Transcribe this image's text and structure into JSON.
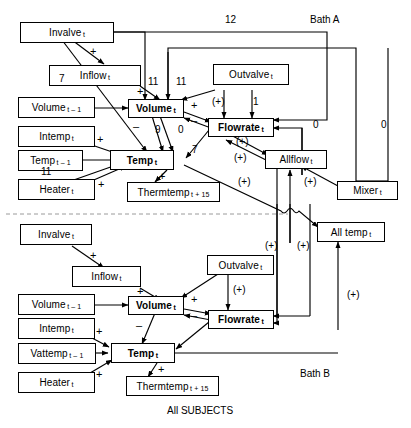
{
  "figure": {
    "caption": "All SUBJECTS",
    "panel_a_label": "Bath A",
    "panel_b_label": "Bath B"
  },
  "nodes": {
    "a_invalve": {
      "label": "Invalve",
      "sub": "t"
    },
    "a_inflow": {
      "label": "Inflow",
      "sub": "t"
    },
    "a_volume_p": {
      "label": "Volume",
      "sub": "t – 1"
    },
    "a_volume": {
      "label": "Volume",
      "sub": "t"
    },
    "a_intemp": {
      "label": "Intemp",
      "sub": "t"
    },
    "a_temp_p": {
      "label": "Temp",
      "sub": "t – 1"
    },
    "a_temp": {
      "label": "Temp",
      "sub": "t"
    },
    "a_heater": {
      "label": "Heater",
      "sub": "t"
    },
    "a_thermtemp": {
      "label": "Thermtemp",
      "sub": "t + 15"
    },
    "a_outvalve": {
      "label": "Outvalve",
      "sub": "t"
    },
    "a_flowrate": {
      "label": "Flowrate",
      "sub": "t"
    },
    "a_allflow": {
      "label": "Allflow",
      "sub": "t"
    },
    "a_mixer": {
      "label": "Mixer",
      "sub": "t"
    },
    "a_alltemp": {
      "label": "All temp",
      "sub": "t"
    },
    "b_invalve": {
      "label": "Invalve",
      "sub": "t"
    },
    "b_inflow": {
      "label": "Inflow",
      "sub": "t"
    },
    "b_volume_p": {
      "label": "Volume",
      "sub": "t – 1"
    },
    "b_volume": {
      "label": "Volume",
      "sub": "t"
    },
    "b_intemp": {
      "label": "Intemp",
      "sub": "t"
    },
    "b_vattemp_p": {
      "label": "Vattemp",
      "sub": "t – 1"
    },
    "b_temp": {
      "label": "Temp",
      "sub": "t"
    },
    "b_heater": {
      "label": "Heater",
      "sub": "t"
    },
    "b_thermtemp": {
      "label": "Thermtemp",
      "sub": "t + 15"
    },
    "b_outvalve": {
      "label": "Outvalve",
      "sub": "t"
    },
    "b_flowrate": {
      "label": "Flowrate",
      "sub": "t"
    }
  },
  "edge_labels": {
    "top_12": "12",
    "a_invalve_temp_7": "7",
    "a_inflow_plus": "+",
    "a_invalve_plus": "+",
    "a_vol_in_11a": "11",
    "a_vol_in_11b": "11",
    "a_vol_flow_plus": "+",
    "a_flow_vol_minus": "–",
    "a_outvalve_pp": "(+)",
    "a_outvalve_1": "1",
    "a_vol_temp_minus": "–",
    "a_vol_temp_9": "9",
    "a_flow_temp_0": "0",
    "a_flow_temp_7": "7",
    "a_intemp_plus": "+",
    "a_heater_plus": "+",
    "a_temp_11": "11",
    "a_thermtemp_plus": "+",
    "a_allflow_pp1": "(+)",
    "a_allflow_pp2": "(+)",
    "a_alltemp_pp": "(+)",
    "a_mixer_pp": "(+)",
    "a_mixer_0": "0",
    "a_right_0": "0",
    "b_inflow_plus": "+",
    "b_vol_plus": "+",
    "b_vol_flow_plus": "+",
    "b_flow_vol_minus": "–",
    "b_outvalve_pp": "(+)",
    "b_vol_temp_minus": "–",
    "b_intemp_plus": "+",
    "b_heater_plus": "+",
    "b_thermtemp_plus": "+",
    "b_flow_pp": "(+)",
    "b_alltemp_pp": "(+)",
    "b_right_pp": "(+)"
  },
  "colors": {
    "stroke": "#000000",
    "background": "#ffffff",
    "divider": "#9a9a9a"
  }
}
